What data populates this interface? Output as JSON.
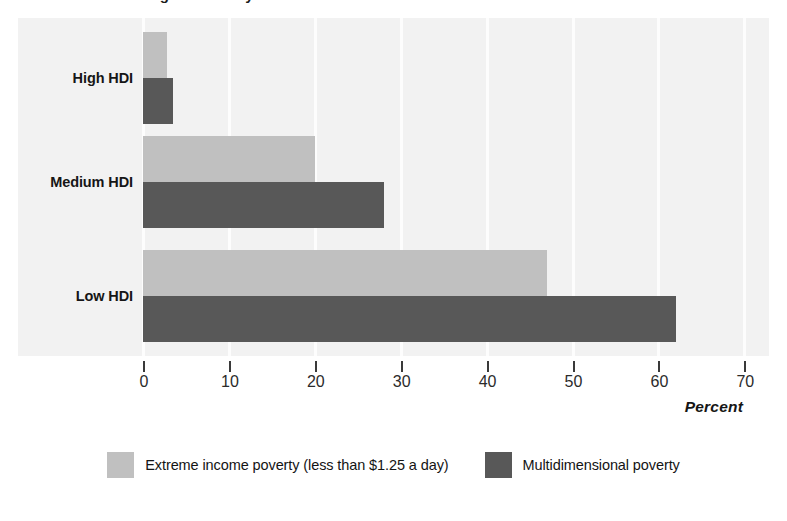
{
  "title_remnant": "Figure  Poverty in",
  "chart_data": {
    "type": "bar",
    "orientation": "horizontal",
    "title": "",
    "xlabel": "Percent",
    "ylabel": "",
    "xlim": [
      0,
      70
    ],
    "xticks": [
      0,
      10,
      20,
      30,
      40,
      50,
      60,
      70
    ],
    "xtick_labels": [
      "0",
      "10",
      "20",
      "30",
      "40",
      "50",
      "60",
      "70"
    ],
    "grid": true,
    "grid_axis": "x",
    "legend_position": "bottom-center",
    "categories": [
      "High HDI",
      "Medium HDI",
      "Low HDI"
    ],
    "series": [
      {
        "name": "Extreme income poverty (less than $1.25 a day)",
        "color": "#c0c0c0",
        "values": [
          2.8,
          20,
          47
        ]
      },
      {
        "name": "Multidimensional poverty",
        "color": "#585858",
        "values": [
          3.5,
          28,
          62
        ]
      }
    ]
  },
  "colors": {
    "series_a": "#c0c0c0",
    "series_b": "#585858",
    "plot_background": "#f2f2f2",
    "gridline": "#fdfdfd",
    "axis": "#3a3a3a",
    "text": "#161616"
  }
}
